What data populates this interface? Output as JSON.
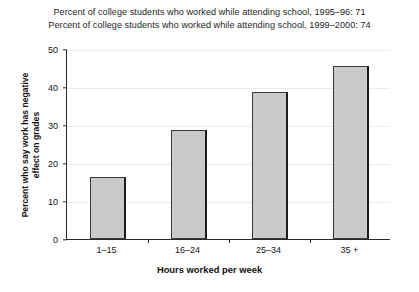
{
  "chart_data": {
    "type": "bar",
    "title": "",
    "titles": [
      "Percent of college students who worked while attending school, 1995–96: 71",
      "Percent of college students who worked while attending school, 1999–2000: 74"
    ],
    "categories": [
      "1–15",
      "16–24",
      "25–34",
      "35 +"
    ],
    "values": [
      16.2,
      28.6,
      38.7,
      45.5
    ],
    "xlabel": "Hours worked per week",
    "ylabel": "Percent who say work has negative effect on grades",
    "ylabel_lines": [
      "Percent who say work has negative",
      "effect on grades"
    ],
    "ylim": [
      0,
      50
    ],
    "yticks": [
      0,
      10,
      20,
      30,
      40,
      50
    ],
    "ytick_labels": [
      "0",
      "10",
      "20",
      "30",
      "40",
      "50"
    ],
    "grid": true,
    "legend": "none",
    "bar_fill": "#c9c9c9",
    "bar_edge": "#3a3a3a",
    "shadow_color": "#1c1c1c",
    "grid_color": "#eceaea",
    "axis_color": "#2b2b2b"
  }
}
